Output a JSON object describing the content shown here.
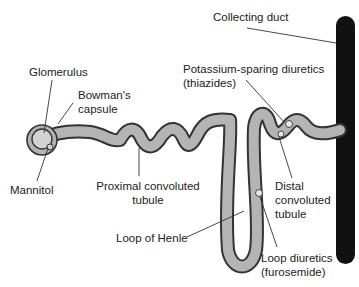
{
  "diagram": {
    "colors": {
      "tubule_fill": "#b4b4b4",
      "tubule_outline": "#333333",
      "collecting_duct": "#111111",
      "glomerulus_fill": "#d2d2d2",
      "leader_line": "#333333",
      "text": "#222222"
    },
    "labels": {
      "collecting_duct": "Collecting duct",
      "glomerulus": "Glomerulus",
      "bowmans_capsule_line1": "Bowman's",
      "bowmans_capsule_line2": "capsule",
      "potassium_line1": "Potassium-sparing diuretics",
      "potassium_line2": "(thiazides)",
      "mannitol": "Mannitol",
      "pct_line1": "Proximal convoluted",
      "pct_line2": "tubule",
      "dct_line1": "Distal",
      "dct_line2": "convoluted",
      "dct_line3": "tubule",
      "loop_of_henle": "Loop of Henle",
      "loop_diuretics_line1": "Loop diuretics",
      "loop_diuretics_line2": "(furosemide)"
    }
  }
}
